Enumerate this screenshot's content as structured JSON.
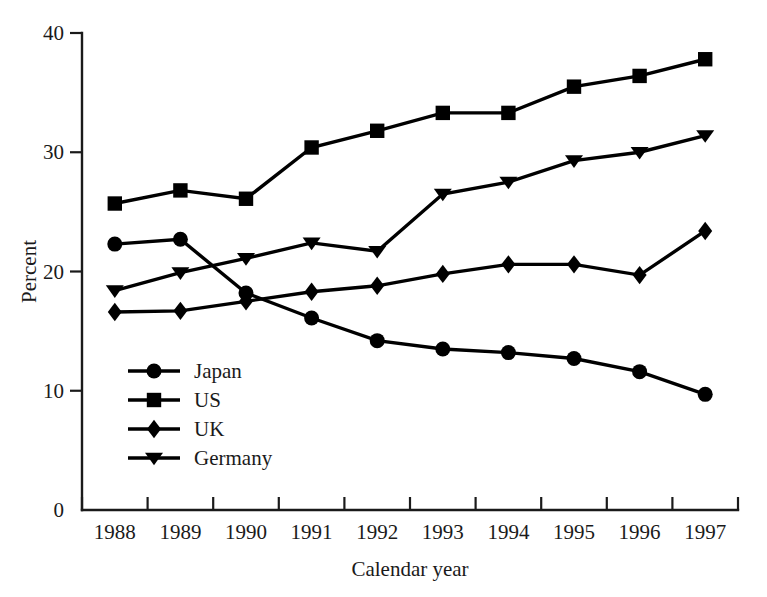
{
  "chart_data": {
    "type": "line",
    "title": "",
    "xlabel": "Calendar year",
    "ylabel": "Percent",
    "x": [
      1988,
      1989,
      1990,
      1991,
      1992,
      1993,
      1994,
      1995,
      1996,
      1997
    ],
    "categories": [
      "1988",
      "1989",
      "1990",
      "1991",
      "1992",
      "1993",
      "1994",
      "1995",
      "1996",
      "1997"
    ],
    "xlim": [
      1987.5,
      1997.5
    ],
    "ylim": [
      0,
      40
    ],
    "yticks": [
      0,
      10,
      20,
      30,
      40
    ],
    "ytick_labels": [
      "0",
      "10",
      "20",
      "30",
      "40"
    ],
    "grid": false,
    "legend_position": "inside-lower-left",
    "series": [
      {
        "name": "Japan",
        "marker": "circle",
        "values": [
          22.3,
          22.7,
          18.2,
          16.1,
          14.2,
          13.5,
          13.2,
          12.7,
          11.6,
          9.7
        ]
      },
      {
        "name": "US",
        "marker": "square",
        "values": [
          25.7,
          26.8,
          26.1,
          30.4,
          31.8,
          33.3,
          33.3,
          35.5,
          36.4,
          37.8
        ]
      },
      {
        "name": "UK",
        "marker": "diamond",
        "values": [
          16.6,
          16.7,
          17.5,
          18.3,
          18.8,
          19.8,
          20.6,
          20.6,
          19.7,
          23.4
        ]
      },
      {
        "name": "Germany",
        "marker": "triangle-down",
        "values": [
          18.4,
          19.9,
          21.1,
          22.4,
          21.7,
          26.5,
          27.5,
          29.3,
          30.0,
          31.4
        ]
      }
    ]
  },
  "legend": {
    "entries": [
      {
        "label": "Japan",
        "marker": "circle"
      },
      {
        "label": "US",
        "marker": "square"
      },
      {
        "label": "UK",
        "marker": "diamond"
      },
      {
        "label": "Germany",
        "marker": "triangle-down"
      }
    ]
  },
  "colors": {
    "ink": "#1a1a1a",
    "series": "#000000",
    "background": "#ffffff"
  }
}
